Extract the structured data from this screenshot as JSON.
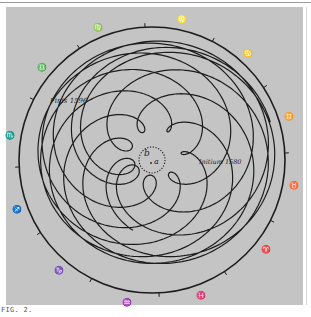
{
  "figure": {
    "caption": "FIG. 2.",
    "labels": {
      "end": "Finis 1596",
      "start": "Initium 1580",
      "center_b": "b",
      "center_a": "a"
    },
    "zodiac": [
      {
        "sign": "Leo",
        "glyph": "♌",
        "angle": 78
      },
      {
        "sign": "Virgo",
        "glyph": "♍",
        "angle": 112
      },
      {
        "sign": "Libra",
        "glyph": "♎",
        "angle": 140
      },
      {
        "sign": "Scorpio",
        "glyph": "♏",
        "angle": 170
      },
      {
        "sign": "Sagittarius",
        "glyph": "♐",
        "angle": 200
      },
      {
        "sign": "Capricorn",
        "glyph": "♑",
        "angle": 230
      },
      {
        "sign": "Aquarius",
        "glyph": "♒",
        "angle": 260
      },
      {
        "sign": "Pisces",
        "glyph": "♓",
        "angle": 290
      },
      {
        "sign": "Aries",
        "glyph": "♈",
        "angle": 322
      },
      {
        "sign": "Taurus",
        "glyph": "♉",
        "angle": 350
      },
      {
        "sign": "Gemini",
        "glyph": "♊",
        "angle": 18
      },
      {
        "sign": "Cancer",
        "glyph": "♋",
        "angle": 48
      }
    ],
    "colors": {
      "plate": "#c4c4c4",
      "ink": "#1d1d1d"
    }
  },
  "chart_data": {
    "type": "diagram",
    "ring": {
      "cx": 152,
      "cy": 160,
      "r": 133,
      "ticks": 12
    },
    "center_circle": {
      "cx": 152,
      "cy": 160,
      "r": 13,
      "style": "dotted"
    },
    "curve": {
      "sun_radius": 1.0,
      "mars_radius": 1.52,
      "period_ratio": 1.881,
      "years": 16.5,
      "scale": 46,
      "eccentricity": 0.14
    }
  }
}
